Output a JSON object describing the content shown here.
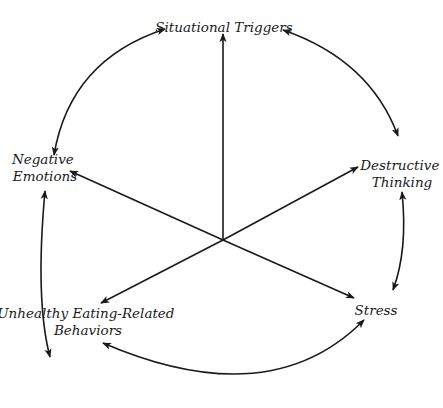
{
  "diagram": {
    "type": "cycle-with-central-hub",
    "center": {
      "x": 223,
      "y": 240
    },
    "nodes": [
      {
        "id": "situational-triggers",
        "lines": [
          "Situational Triggers"
        ]
      },
      {
        "id": "destructive-thinking",
        "lines": [
          "Destructive",
          "Thinking"
        ]
      },
      {
        "id": "stress",
        "lines": [
          "Stress"
        ]
      },
      {
        "id": "unhealthy-eating",
        "lines": [
          "Unhealthy Eating-Related",
          "Behaviors"
        ]
      },
      {
        "id": "negative-emotions",
        "lines": [
          "Negative",
          "Emotions"
        ]
      }
    ],
    "edges": [
      {
        "from": "situational-triggers",
        "to": "destructive-thinking",
        "kind": "bidirectional-arc"
      },
      {
        "from": "destructive-thinking",
        "to": "stress",
        "kind": "bidirectional-arc"
      },
      {
        "from": "stress",
        "to": "unhealthy-eating",
        "kind": "bidirectional-arc"
      },
      {
        "from": "unhealthy-eating",
        "to": "negative-emotions",
        "kind": "bidirectional-arc"
      },
      {
        "from": "negative-emotions",
        "to": "situational-triggers",
        "kind": "bidirectional-arc"
      },
      {
        "from": "center",
        "to": "situational-triggers",
        "kind": "spoke-arrow"
      },
      {
        "from": "center",
        "to": "destructive-thinking",
        "kind": "spoke-arrow"
      },
      {
        "from": "center",
        "to": "stress",
        "kind": "spoke-arrow"
      },
      {
        "from": "center",
        "to": "unhealthy-eating",
        "kind": "spoke-arrow"
      },
      {
        "from": "center",
        "to": "negative-emotions",
        "kind": "spoke-arrow"
      }
    ],
    "stroke_color": "#1a1a1a",
    "background": "#ffffff"
  }
}
